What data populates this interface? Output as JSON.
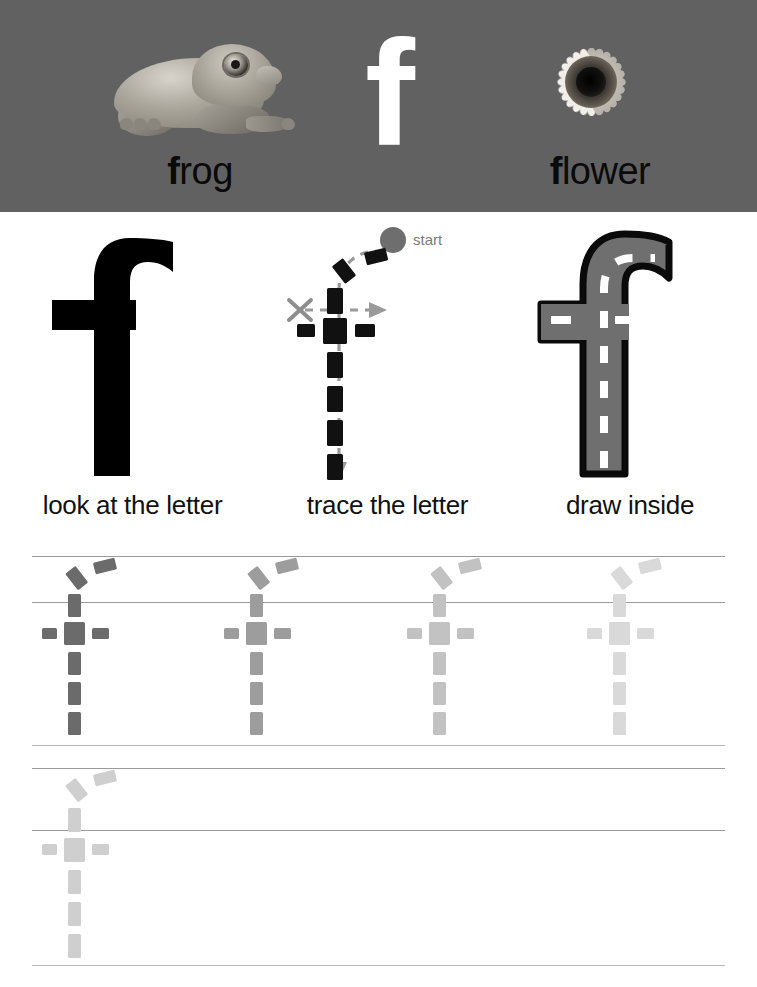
{
  "document": {
    "type": "handwriting-worksheet",
    "letter": "f",
    "letter_case": "lowercase"
  },
  "header": {
    "background_color": "#616161",
    "big_letter": "f",
    "big_letter_color": "#ffffff",
    "items": [
      {
        "name": "frog",
        "image": "frog-photo",
        "word_initial": "f",
        "word_rest": "rog"
      },
      {
        "name": "letter",
        "image": "letter-f-glyph"
      },
      {
        "name": "flower",
        "image": "flower-photo",
        "word_initial": "f",
        "word_rest": "lower"
      }
    ]
  },
  "demo": {
    "columns": [
      {
        "key": "look",
        "caption": "look at the letter",
        "art": "solid-black-f"
      },
      {
        "key": "trace",
        "caption": "trace the letter",
        "art": "dashed-f-with-guides",
        "start_label": "start",
        "start_dot_color": "#6e6e6e",
        "x_mark": "X"
      },
      {
        "key": "draw",
        "caption": "draw inside",
        "art": "road-outline-f",
        "road_fill": "#6f6f6f",
        "road_stroke": "#0a0a0a",
        "center_line": "#ffffff"
      }
    ]
  },
  "practice": {
    "rows": [
      {
        "index": 1,
        "rules": [
          556,
          602,
          745
        ],
        "letters": [
          {
            "x": 75,
            "color": "#6b6b6b"
          },
          {
            "x": 257,
            "color": "#9d9d9d"
          },
          {
            "x": 440,
            "color": "#c2c2c2"
          },
          {
            "x": 620,
            "color": "#d9d9d9"
          }
        ]
      },
      {
        "index": 2,
        "rules": [
          768,
          830,
          965
        ],
        "letters": [
          {
            "x": 75,
            "color": "#cfcfcf"
          }
        ]
      }
    ],
    "rule_color": "#9a9a9a"
  },
  "colors": {
    "header_gray": "#616161",
    "ink_black": "#000000",
    "road_gray": "#6f6f6f",
    "guide_gray": "#8e8e8e",
    "page_white": "#ffffff"
  }
}
